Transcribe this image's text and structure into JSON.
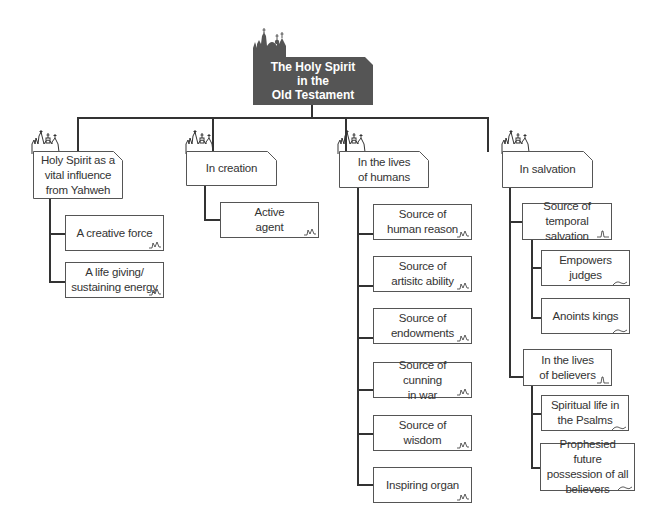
{
  "diagram": {
    "type": "hierarchy-tree",
    "root": {
      "label": "The Holy Spirit\nin the\nOld Testament"
    },
    "branches": [
      {
        "label": "Holy Spirit as a\nvital influence\nfrom Yahweh",
        "children": [
          {
            "label": "A creative force"
          },
          {
            "label": "A life giving/\nsustaining energy"
          }
        ]
      },
      {
        "label": "In creation",
        "children": [
          {
            "label": "Active\nagent"
          }
        ]
      },
      {
        "label": "In the lives\nof humans",
        "children": [
          {
            "label": "Source of\nhuman reason"
          },
          {
            "label": "Source of\nartisitc ability"
          },
          {
            "label": "Source of\nendowments"
          },
          {
            "label": "Source of cunning\nin war"
          },
          {
            "label": "Source of\nwisdom"
          },
          {
            "label": "Inspiring organ"
          }
        ]
      },
      {
        "label": "In salvation",
        "children": [
          {
            "label": "Source of temporal\nsalvation",
            "children": [
              {
                "label": "Empowers\njudges"
              },
              {
                "label": "Anoints kings"
              }
            ]
          },
          {
            "label": "In the lives\nof believers",
            "children": [
              {
                "label": "Spiritual life in\nthe Psalms"
              },
              {
                "label": "Prophesied future\npossession of all\nbelievers"
              }
            ]
          }
        ]
      }
    ]
  },
  "colors": {
    "header_fill": "#555555",
    "header_text": "#ffffff",
    "line": "#333333",
    "box_border": "#555555",
    "text": "#333333"
  },
  "icons": {
    "header": "cathedral-silhouette-icon",
    "branch": "church-outline-icon",
    "leaf_corner": "squiggle-icon"
  }
}
